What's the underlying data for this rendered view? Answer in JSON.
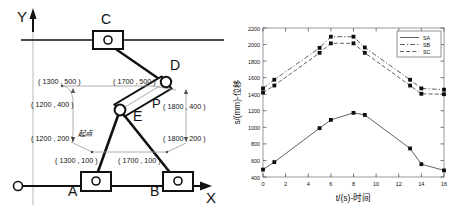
{
  "figure": {
    "left_panel": {
      "name": "mechanism-linkage-diagram",
      "axes": {
        "x_label": "X",
        "y_label": "Y",
        "origin_label": "O"
      },
      "joints": [
        {
          "id": "A",
          "label": "A",
          "type": "slider-block"
        },
        {
          "id": "B",
          "label": "B",
          "type": "slider-block"
        },
        {
          "id": "C",
          "label": "C",
          "type": "slider-block"
        },
        {
          "id": "D",
          "label": "D",
          "type": "pin-joint"
        },
        {
          "id": "E",
          "label": "E",
          "type": "pin-joint"
        },
        {
          "id": "P",
          "label": "P",
          "type": "point"
        }
      ],
      "annotation": {
        "start_point": "起点"
      },
      "coordinates": [
        {
          "label": "( 1300 , 500 )",
          "x": 1300,
          "y": 500
        },
        {
          "label": "( 1700 , 500 )",
          "x": 1700,
          "y": 500
        },
        {
          "label": "( 1200 , 400 )",
          "x": 1200,
          "y": 400
        },
        {
          "label": "( 1800 , 400 )",
          "x": 1800,
          "y": 400
        },
        {
          "label": "( 1200 , 200 )",
          "x": 1200,
          "y": 200
        },
        {
          "label": "( 1800 , 200 )",
          "x": 1800,
          "y": 200
        },
        {
          "label": "( 1300 , 100 )",
          "x": 1300,
          "y": 100
        },
        {
          "label": "( 1700 , 100 )",
          "x": 1700,
          "y": 100
        }
      ]
    }
  },
  "chart_data": {
    "type": "line",
    "title": "",
    "xlabel": "t/(s)-时间",
    "ylabel": "s/(mm)-位移",
    "xlim": [
      0,
      16
    ],
    "ylim": [
      400,
      2200
    ],
    "xticks": [
      0,
      2,
      4,
      6,
      8,
      10,
      12,
      14,
      16
    ],
    "yticks": [
      400,
      600,
      800,
      1000,
      1200,
      1400,
      1600,
      1800,
      2000,
      2200
    ],
    "grid": false,
    "legend_position": "top-right",
    "legend": [
      "SA",
      "SB",
      "SC"
    ],
    "series": [
      {
        "name": "SA",
        "style": "solid",
        "x": [
          0,
          1,
          5,
          6,
          8,
          9,
          13,
          14,
          16
        ],
        "values": [
          490,
          580,
          990,
          1090,
          1175,
          1150,
          745,
          555,
          480
        ]
      },
      {
        "name": "SB",
        "style": "dash-dot",
        "x": [
          0,
          1,
          5,
          6,
          8,
          9,
          13,
          14,
          16
        ],
        "values": [
          1470,
          1575,
          1960,
          2095,
          2095,
          1965,
          1575,
          1470,
          1455
        ]
      },
      {
        "name": "SC",
        "style": "dashed",
        "x": [
          0,
          1,
          5,
          6,
          8,
          9,
          13,
          14,
          16
        ],
        "values": [
          1420,
          1505,
          1900,
          2015,
          2015,
          1900,
          1505,
          1405,
          1400
        ]
      }
    ]
  }
}
